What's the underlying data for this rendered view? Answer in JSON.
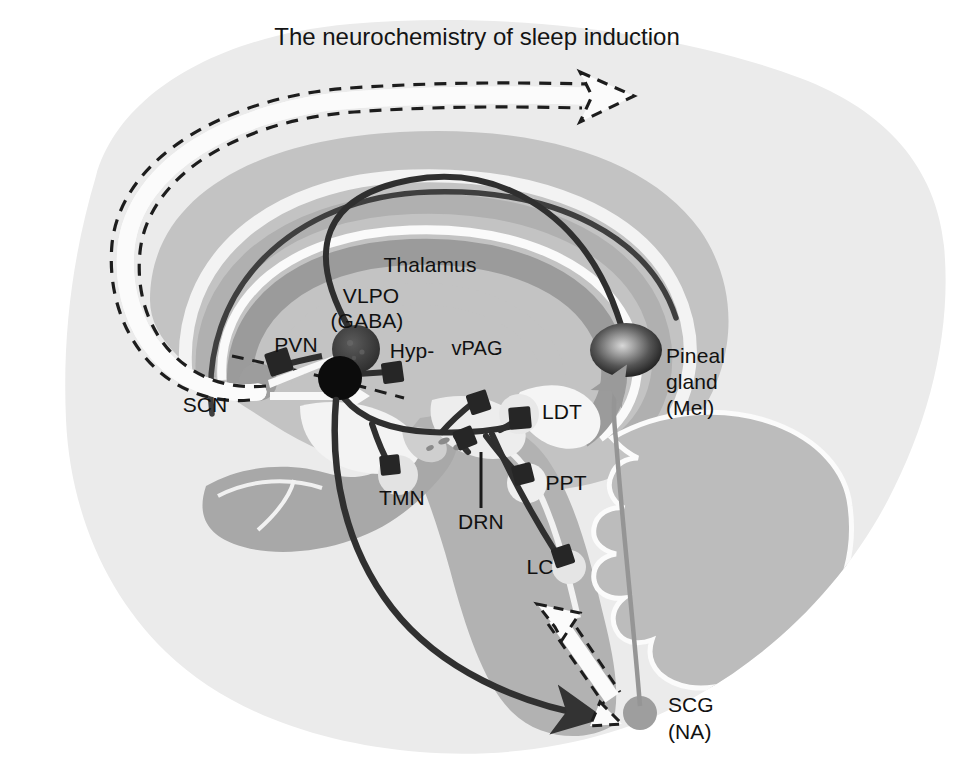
{
  "figure": {
    "title": "The neurochemistry of sleep induction",
    "domain": "neuroanatomy-schematic",
    "background_color": "#ffffff"
  },
  "palette": {
    "page_background": "#ffffff",
    "brain_outline_fill": "#ececec",
    "cortex_mid_gray": "#b9b9b9",
    "deep_gray": "#9a9a9a",
    "white_matter": "#f4f4f4",
    "pathway_dark": "#3a3a3a",
    "pathway_black": "#101010",
    "nucleus_light": "#e6e6e6",
    "nucleus_gray": "#9d9d9d",
    "melatonin_line": "#8e8e8e",
    "label_text": "#111111"
  },
  "labels": {
    "title": "The neurochemistry of sleep induction",
    "thalamus": "Thalamus",
    "vlpo_line1": "VLPO",
    "vlpo_line2": "(GABA)",
    "pvn": "PVN",
    "hyp": "Hyp-",
    "vpag": "vPAG",
    "scn": "SCN",
    "ldt": "LDT",
    "ppt": "PPT",
    "tmn": "TMN",
    "drn": "DRN",
    "lc": "LC",
    "pineal_line1": "Pineal",
    "pineal_line2": "gland",
    "pineal_line3": "(Mel)",
    "scg_line1": "SCG",
    "scg_line2": "(NA)"
  },
  "structures": [
    {
      "id": "scn",
      "label": "SCN",
      "type": "nucleus",
      "fill": "#9d9d9d",
      "cx": 258,
      "cy": 382,
      "r": 19
    },
    {
      "id": "vlpo",
      "label": "VLPO (GABA)",
      "type": "nucleus",
      "fill": "#3c3c3c",
      "cx": 356,
      "cy": 349,
      "r": 23
    },
    {
      "id": "pvn-node",
      "label": "PVN",
      "type": "nucleus",
      "fill": "#0d0d0d",
      "cx": 340,
      "cy": 378,
      "r": 22
    },
    {
      "id": "tmn",
      "label": "TMN",
      "type": "nucleus",
      "fill": "#e2e2e2",
      "cx": 398,
      "cy": 475,
      "r": 20
    },
    {
      "id": "ldt",
      "label": "LDT",
      "type": "nucleus",
      "fill": "#e6e6e6",
      "cx": 519,
      "cy": 414,
      "r": 20
    },
    {
      "id": "ppt",
      "label": "PPT",
      "type": "nucleus",
      "fill": "#ededed",
      "cx": 527,
      "cy": 483,
      "r": 20
    },
    {
      "id": "lc",
      "label": "LC",
      "type": "nucleus",
      "fill": "#e4e4e4",
      "cx": 569,
      "cy": 567,
      "r": 17
    },
    {
      "id": "pineal",
      "label": "Pineal gland (Mel)",
      "type": "gland",
      "fill": "radial-gradient",
      "cx": 626,
      "cy": 350,
      "rx": 35,
      "ry": 26
    },
    {
      "id": "scg",
      "label": "SCG (NA)",
      "type": "ganglion",
      "fill": "#9c9c9c",
      "cx": 640,
      "cy": 713,
      "r": 16
    }
  ],
  "label_positions": {
    "title": {
      "x": 477,
      "y": 45,
      "anchor": "middle"
    },
    "thalamus": {
      "x": 430,
      "y": 272,
      "anchor": "middle"
    },
    "vlpo_line1": {
      "x": 371,
      "y": 303,
      "anchor": "middle"
    },
    "vlpo_line2": {
      "x": 367,
      "y": 328,
      "anchor": "middle"
    },
    "pvn": {
      "x": 296,
      "y": 352,
      "anchor": "middle"
    },
    "hyp": {
      "x": 410,
      "y": 358,
      "anchor": "middle"
    },
    "vpag": {
      "x": 475,
      "y": 355,
      "anchor": "middle"
    },
    "scn": {
      "x": 205,
      "y": 412,
      "anchor": "middle"
    },
    "ldt": {
      "x": 562,
      "y": 418,
      "anchor": "middle"
    },
    "ppt": {
      "x": 566,
      "y": 489,
      "anchor": "middle"
    },
    "tmn": {
      "x": 402,
      "y": 505,
      "anchor": "middle"
    },
    "drn": {
      "x": 481,
      "y": 527,
      "anchor": "middle"
    },
    "lc": {
      "x": 540,
      "y": 573,
      "anchor": "middle"
    },
    "pineal_line1": {
      "x": 666,
      "y": 363,
      "anchor": "start"
    },
    "pineal_line2": {
      "x": 666,
      "y": 389,
      "anchor": "start"
    },
    "pineal_line3": {
      "x": 666,
      "y": 415,
      "anchor": "start"
    },
    "scg_line1": {
      "x": 668,
      "y": 712,
      "anchor": "start"
    },
    "scg_line2": {
      "x": 668,
      "y": 739,
      "anchor": "start"
    }
  },
  "pathways": [
    {
      "id": "dashed-white-top",
      "from": "SCN",
      "to": "cortex",
      "style": "white-fill dashed-outline arrow",
      "direction": "rightward-arc"
    },
    {
      "id": "dashed-white-bottom",
      "from": "brainstem",
      "to": "SCG",
      "style": "white-fill dashed-outline arrow",
      "direction": "down-right"
    },
    {
      "id": "vlpo-to-cortex",
      "from": "VLPO",
      "to": "thalamus-arc",
      "style": "thick dark curve"
    },
    {
      "id": "vlpo-to-brainstem",
      "from": "VLPO",
      "to": "LDT/PPT/LC/TMN/DRN",
      "style": "branching dark with square boutons"
    },
    {
      "id": "pineal-to-thalamus",
      "from": "pineal",
      "to": "thalamus",
      "style": "thick dark curve"
    },
    {
      "id": "scg-to-pineal",
      "from": "SCG",
      "to": "pineal",
      "style": "thin gray line",
      "color": "#8e8e8e"
    },
    {
      "id": "hyp-to-scg",
      "from": "hypothalamus",
      "to": "SCG",
      "style": "long dark curve with arrowhead"
    }
  ]
}
